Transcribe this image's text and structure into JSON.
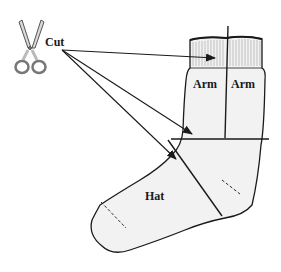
{
  "diagram": {
    "type": "illustration",
    "labels": {
      "cut": "Cut",
      "arm_left": "Arm",
      "arm_right": "Arm",
      "hat": "Hat"
    },
    "icons": [
      "scissors-icon"
    ],
    "colors": {
      "line": "#1a1a1a",
      "sock_fill": "#f2f2f2",
      "rib": "#9a9a9a",
      "scissors_fill": "#d9d9d9"
    },
    "arrows": [
      {
        "from": "Cut",
        "to": "cuff-ribbing"
      },
      {
        "from": "Cut",
        "to": "horizontal-cut-line"
      },
      {
        "from": "Cut",
        "to": "diagonal-cut-line"
      }
    ]
  }
}
